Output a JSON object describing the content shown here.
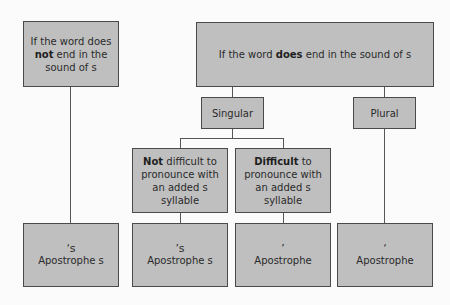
{
  "diagram": {
    "box_fill": "#bfbfbf",
    "box_border": "#4a4a4a",
    "nodes": {
      "not_end_s": {
        "pre": "If the word does ",
        "bold": "not",
        "post": " end in the sound of s"
      },
      "does_end_s": {
        "pre": "If the word ",
        "bold": "does",
        "post": " end in the sound of s"
      },
      "singular": {
        "label": "Singular"
      },
      "plural": {
        "label": "Plural"
      },
      "not_difficult": {
        "bold": "Not",
        "post": " difficult to pronounce with an added s syllable"
      },
      "difficult": {
        "bold": "Difficult",
        "post": " to pronounce with an added s syllable"
      },
      "result_1": {
        "symbol": "‘s",
        "label": "Apostrophe s"
      },
      "result_2": {
        "symbol": "’s",
        "label": "Apostrophe s"
      },
      "result_3": {
        "symbol": "’",
        "label": "Apostrophe"
      },
      "result_4": {
        "symbol": "‘",
        "label": "Apostrophe"
      }
    }
  }
}
